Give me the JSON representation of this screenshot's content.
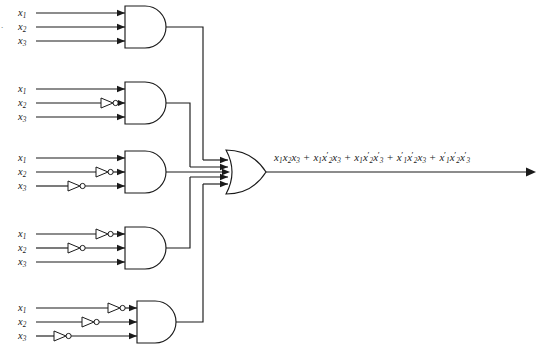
{
  "figure": {
    "corner_mark": "."
  },
  "colors": {
    "wire": "#1a1a1a",
    "gate_fill": "#ffffff",
    "background": "#ffffff",
    "text": "#1a1a1a"
  },
  "input_labels": {
    "x1": "x",
    "x1_sub": "1",
    "x2": "x",
    "x2_sub": "2",
    "x3": "x",
    "x3_sub": "3"
  },
  "and_gates": [
    {
      "id": "and-gate-1",
      "name": "AND gate 1",
      "term": "x1 x2 x3",
      "inverted_inputs": [],
      "inputs": [
        {
          "label": "x",
          "sub": "1",
          "inverted": false
        },
        {
          "label": "x",
          "sub": "2",
          "inverted": false
        },
        {
          "label": "x",
          "sub": "3",
          "inverted": false
        }
      ]
    },
    {
      "id": "and-gate-2",
      "name": "AND gate 2",
      "term": "x1 x2' x3",
      "inverted_inputs": [
        "x2"
      ],
      "inputs": [
        {
          "label": "x",
          "sub": "1",
          "inverted": false
        },
        {
          "label": "x",
          "sub": "2",
          "inverted": true
        },
        {
          "label": "x",
          "sub": "3",
          "inverted": false
        }
      ]
    },
    {
      "id": "and-gate-3",
      "name": "AND gate 3",
      "term": "x1 x2' x3'",
      "inverted_inputs": [
        "x2",
        "x3"
      ],
      "inputs": [
        {
          "label": "x",
          "sub": "1",
          "inverted": false
        },
        {
          "label": "x",
          "sub": "2",
          "inverted": true
        },
        {
          "label": "x",
          "sub": "3",
          "inverted": true
        }
      ]
    },
    {
      "id": "and-gate-4",
      "name": "AND gate 4",
      "term": "x1' x2' x3",
      "inverted_inputs": [
        "x1",
        "x2"
      ],
      "inputs": [
        {
          "label": "x",
          "sub": "1",
          "inverted": true
        },
        {
          "label": "x",
          "sub": "2",
          "inverted": true
        },
        {
          "label": "x",
          "sub": "3",
          "inverted": false
        }
      ]
    },
    {
      "id": "and-gate-5",
      "name": "AND gate 5",
      "term": "x1' x2' x3'",
      "inverted_inputs": [
        "x1",
        "x2",
        "x3"
      ],
      "inputs": [
        {
          "label": "x",
          "sub": "1",
          "inverted": true
        },
        {
          "label": "x",
          "sub": "2",
          "inverted": true
        },
        {
          "label": "x",
          "sub": "3",
          "inverted": true
        }
      ]
    }
  ],
  "or_gate": {
    "id": "or-gate",
    "name": "OR gate",
    "input_count": 5
  },
  "output": {
    "terms": [
      {
        "vars": [
          {
            "v": "x",
            "s": "1",
            "p": false
          },
          {
            "v": "x",
            "s": "2",
            "p": false
          },
          {
            "v": "x",
            "s": "3",
            "p": false
          }
        ]
      },
      {
        "vars": [
          {
            "v": "x",
            "s": "1",
            "p": false
          },
          {
            "v": "x",
            "s": "2",
            "p": true
          },
          {
            "v": "x",
            "s": "3",
            "p": false
          }
        ]
      },
      {
        "vars": [
          {
            "v": "x",
            "s": "1",
            "p": false
          },
          {
            "v": "x",
            "s": "2",
            "p": true
          },
          {
            "v": "x",
            "s": "3",
            "p": true
          }
        ]
      },
      {
        "vars": [
          {
            "v": "x",
            "s": "1",
            "p": true
          },
          {
            "v": "x",
            "s": "2",
            "p": true
          },
          {
            "v": "x",
            "s": "3",
            "p": false
          }
        ]
      },
      {
        "vars": [
          {
            "v": "x",
            "s": "1",
            "p": true
          },
          {
            "v": "x",
            "s": "2",
            "p": true
          },
          {
            "v": "x",
            "s": "3",
            "p": true
          }
        ]
      }
    ],
    "operator": "+",
    "plain_text": "x1x2x3 + x1x2'x3 + x1x2'x3' + x1'x2'x3 + x1'x2'x3'"
  },
  "icons": {
    "inverter": "not-gate-icon",
    "bubble": "inversion-bubble-icon",
    "arrow": "signal-arrowhead-icon"
  }
}
